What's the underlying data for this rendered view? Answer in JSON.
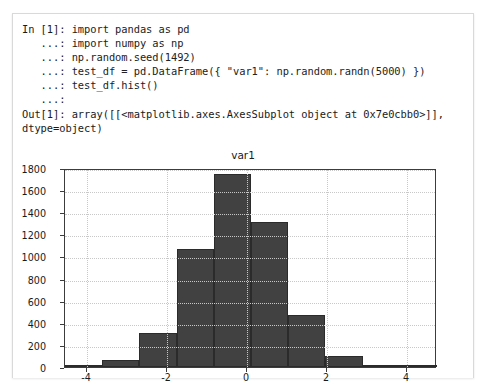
{
  "notebook": {
    "code_lines": [
      {
        "prompt": "In [1]: ",
        "code": "import pandas as pd"
      },
      {
        "prompt": "   ...: ",
        "code": "import numpy as np"
      },
      {
        "prompt": "   ...: ",
        "code": "np.random.seed(1492)"
      },
      {
        "prompt": "   ...: ",
        "code": "test_df = pd.DataFrame({ \"var1\": np.random.randn(5000) })"
      },
      {
        "prompt": "   ...: ",
        "code": "test_df.hist()"
      },
      {
        "prompt": "   ...: ",
        "code": ""
      }
    ],
    "output_lines": [
      "Out[1]: array([[<matplotlib.axes.AxesSubplot object at 0x7e0cbb0>]],",
      "dtype=object)"
    ]
  },
  "chart_data": {
    "type": "bar",
    "title": "var1",
    "xlabel": "",
    "ylabel": "",
    "grid": true,
    "legend": null,
    "xlim": [
      -4.55,
      4.75
    ],
    "ylim": [
      0,
      1800
    ],
    "xticks": [
      "-4",
      "-2",
      "0",
      "2",
      "4"
    ],
    "xtick_values": [
      -4,
      -2,
      0,
      2,
      4
    ],
    "yticks": [
      "0",
      "200",
      "400",
      "600",
      "800",
      "1000",
      "1200",
      "1400",
      "1600",
      "1800"
    ],
    "ytick_values": [
      0,
      200,
      400,
      600,
      800,
      1000,
      1200,
      1400,
      1600,
      1800
    ],
    "bin_edges": [
      -4.55,
      -3.62,
      -2.69,
      -1.76,
      -0.83,
      0.1,
      1.03,
      1.96,
      2.89,
      3.82,
      4.75
    ],
    "values": [
      10,
      62,
      305,
      1065,
      1745,
      1315,
      470,
      100,
      15,
      5
    ],
    "bar_color": "#414141",
    "bar_edge_color": "#2b2b2b"
  }
}
